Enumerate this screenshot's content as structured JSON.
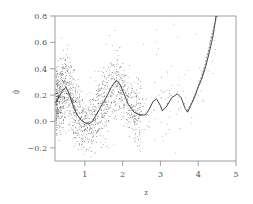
{
  "chart_data": {
    "type": "scatter",
    "title": "",
    "xlabel": "z",
    "ylabel": "ĝ",
    "xlim": [
      0.21,
      5.0
    ],
    "ylim": [
      -0.3,
      0.8
    ],
    "xticks": [
      1,
      2,
      3,
      4,
      5
    ],
    "xtick_labels": [
      "1",
      "2",
      "3",
      "4",
      "5"
    ],
    "yticks": [
      -0.2,
      0.0,
      0.2,
      0.4,
      0.6,
      0.8
    ],
    "ytick_labels": [
      "−0.2",
      "0.0",
      "0.2",
      "0.4",
      "0.6",
      "0.8"
    ],
    "grid": false,
    "legend": null,
    "series": [
      {
        "name": "estimate",
        "style": "solid-line",
        "x": [
          0.22,
          0.3,
          0.4,
          0.5,
          0.6,
          0.7,
          0.8,
          0.9,
          1.0,
          1.1,
          1.2,
          1.3,
          1.4,
          1.5,
          1.6,
          1.7,
          1.8,
          1.85,
          1.95,
          2.05,
          2.15,
          2.3,
          2.45,
          2.6,
          2.7,
          2.8,
          2.9,
          3.0,
          3.05,
          3.15,
          3.3,
          3.45,
          3.55,
          3.65,
          3.72,
          3.8,
          3.9,
          4.0,
          4.1,
          4.2,
          4.3,
          4.4,
          4.47
        ],
        "y": [
          0.14,
          0.18,
          0.23,
          0.26,
          0.2,
          0.11,
          0.05,
          0.01,
          -0.01,
          -0.02,
          0.0,
          0.05,
          0.1,
          0.15,
          0.2,
          0.26,
          0.3,
          0.31,
          0.27,
          0.2,
          0.13,
          0.07,
          0.05,
          0.05,
          0.09,
          0.15,
          0.17,
          0.12,
          0.08,
          0.11,
          0.18,
          0.21,
          0.18,
          0.1,
          0.07,
          0.12,
          0.18,
          0.26,
          0.33,
          0.42,
          0.53,
          0.66,
          0.8
        ]
      },
      {
        "name": "reference",
        "style": "dashed-line",
        "x": [
          3.7,
          3.8,
          3.9,
          4.0,
          4.1,
          4.2,
          4.3,
          4.4,
          4.5
        ],
        "y": [
          0.08,
          0.13,
          0.19,
          0.27,
          0.35,
          0.45,
          0.57,
          0.7,
          0.82
        ]
      },
      {
        "name": "observations",
        "style": "points",
        "note": "dense noisy point cloud concentrated around the curve, heaviest in x 0.2–2.3, sparse beyond x 2.5"
      }
    ]
  }
}
